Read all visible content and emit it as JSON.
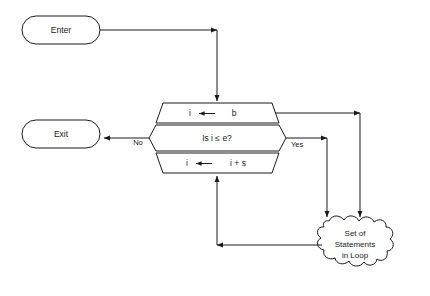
{
  "diagram": {
    "type": "flowchart",
    "background_color": "#ffffff",
    "line_color": "#1a1a1a",
    "nodes": {
      "enter": {
        "label": "Enter",
        "shape": "terminator-rounded",
        "x": 22,
        "y": 16,
        "width": 78,
        "height": 28
      },
      "exit": {
        "label": "Exit",
        "shape": "terminator-rounded",
        "x": 22,
        "y": 120,
        "width": 78,
        "height": 28
      },
      "init": {
        "label_var": "i",
        "label_arrow": "←",
        "label_value": "b",
        "label_full": "i ← b",
        "shape": "trapezoid-top"
      },
      "test": {
        "label": "Is i ≤ e?",
        "shape": "hexagon-middle"
      },
      "increment": {
        "label_var": "i",
        "label_arrow": "←",
        "label_value": "i + s",
        "label_full": "i ← i + s",
        "shape": "trapezoid-bottom"
      },
      "loop_body": {
        "lines": [
          "Set of",
          "Statements",
          "in Loop"
        ],
        "shape": "cloud-jagged"
      }
    },
    "branch_labels": {
      "no": "No",
      "yes": "Yes"
    },
    "edges": [
      {
        "from": "enter",
        "to": "init",
        "label": ""
      },
      {
        "from": "init",
        "to": "loop_body",
        "label": ""
      },
      {
        "from": "test",
        "to": "exit",
        "label": "No"
      },
      {
        "from": "test",
        "to": "loop_body",
        "label": "Yes"
      },
      {
        "from": "loop_body",
        "to": "increment",
        "label": ""
      }
    ]
  }
}
